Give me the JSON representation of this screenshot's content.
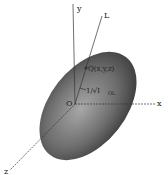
{
  "diagram": {
    "title": "",
    "axes": {
      "x_label": "x",
      "y_label": "y",
      "z_label": "z",
      "line_label": "L"
    },
    "origin_label": "O",
    "point_label": "Q(x,y,z)",
    "distance_label": "1/√I",
    "distance_subscript": "OL",
    "colors": {
      "ellipsoid_dark": "#3a3a3a",
      "ellipsoid_light": "#9a9a9a",
      "axis": "#333333",
      "background": "#ffffff"
    }
  }
}
